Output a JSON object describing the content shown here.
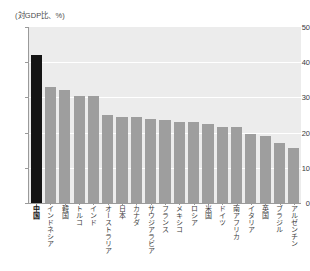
{
  "chart_data": {
    "type": "bar",
    "title": "(対GDP比、%)",
    "xlabel": "",
    "ylabel": "",
    "ylim": [
      0,
      50
    ],
    "yticks": [
      0,
      10,
      20,
      30,
      40,
      50
    ],
    "grid": true,
    "legend": null,
    "categories": [
      "中国",
      "インドネシア",
      "韓国",
      "トルコ",
      "インド",
      "オーストラリア",
      "日本",
      "カナダ",
      "サウジアラビア",
      "フランス",
      "メキシコ",
      "ロシア",
      "米国",
      "ドイツ",
      "南アフリカ",
      "イタリア",
      "英国",
      "ブラジル",
      "アルゼンチン"
    ],
    "values": [
      42,
      33,
      32,
      30.5,
      30.5,
      25,
      24.5,
      24.5,
      24,
      23.5,
      23,
      23,
      22.5,
      21.5,
      21.5,
      19.5,
      19,
      17,
      15.5
    ],
    "highlight_category": "中国",
    "highlight_index": 0,
    "colors": {
      "bar": "#9e9e9e",
      "bar_highlight": "#141414",
      "plot_background": "#ececec",
      "gridline": "#ffffff",
      "axis": "#9a9a9a",
      "text": "#3c3c3c",
      "page_background": "#ffffff"
    }
  }
}
